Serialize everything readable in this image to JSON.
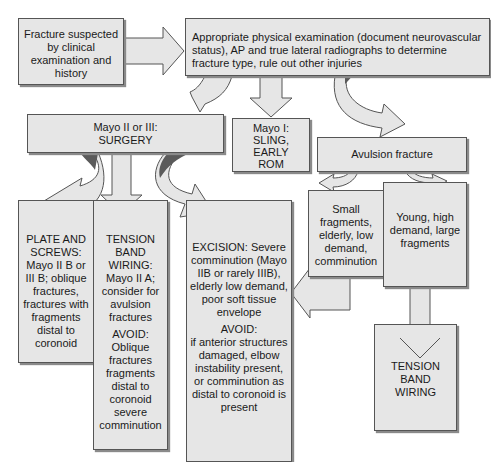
{
  "diagram": {
    "title_mark": "",
    "nodes": {
      "start": {
        "text": "Fracture suspected by clinical examination and history"
      },
      "exam": {
        "text": "Appropriate physical examination (document neurovascular status), AP and true lateral radiographs to determine fracture type, rule out other injuries"
      },
      "mayo23": {
        "line1": "Mayo II or III:",
        "line2": "SURGERY"
      },
      "mayo1": {
        "line1": "Mayo I:",
        "line2": "SLING,",
        "line3": "EARLY",
        "line4": "ROM"
      },
      "avulsion": {
        "text": "Avulsion fracture"
      },
      "plate": {
        "text": "PLATE AND SCREWS: Mayo II B or III B; oblique fractures, fractures with fragments distal to coronoid"
      },
      "tension_left": {
        "text": "TENSION BAND WIRING: Mayo II A; consider for avulsion fractures",
        "avoid": "AVOID: Oblique fractures fragments distal to coronoid severe comminution"
      },
      "excision": {
        "text": "EXCISION: Severe comminution (Mayo IIB or rarely IIIB), elderly low demand, poor soft tissue envelope",
        "avoid_label": "AVOID:",
        "avoid": "if anterior structures damaged, elbow instability present, or comminution as distal to coronoid is present"
      },
      "small": {
        "text": "Small fragments, elderly, low demand, comminution"
      },
      "young": {
        "text": "Young, high demand, large fragments"
      },
      "tension_right": {
        "line1": "TENSION",
        "line2": "BAND",
        "line3": "WIRING"
      }
    },
    "edges": [
      {
        "from": "start",
        "to": "exam"
      },
      {
        "from": "exam",
        "to": "mayo23"
      },
      {
        "from": "exam",
        "to": "mayo1"
      },
      {
        "from": "exam",
        "to": "avulsion"
      },
      {
        "from": "mayo23",
        "to": "plate"
      },
      {
        "from": "mayo23",
        "to": "tension_left"
      },
      {
        "from": "mayo23",
        "to": "excision"
      },
      {
        "from": "avulsion",
        "to": "small"
      },
      {
        "from": "avulsion",
        "to": "young"
      },
      {
        "from": "small",
        "to": "excision"
      },
      {
        "from": "young",
        "to": "tension_right"
      }
    ],
    "colors": {
      "box_fill": "#e6e6e6",
      "box_border": "#555555",
      "shadow": "#8a8a8a",
      "dark_fold": "#5a5a5a"
    }
  }
}
